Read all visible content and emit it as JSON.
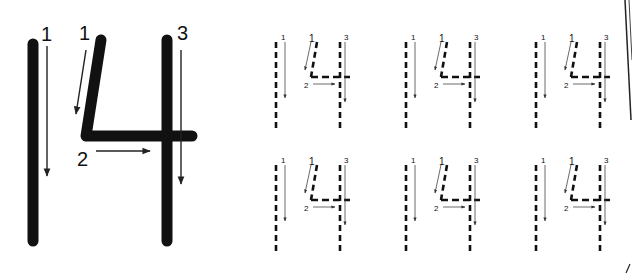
{
  "worksheet": {
    "number": "14",
    "ink_color": "#111111",
    "arrow_color": "#333333",
    "example": {
      "digit_one": {
        "stroke_label": "1"
      },
      "digit_four": {
        "stroke_labels": [
          "1",
          "2",
          "3"
        ]
      }
    },
    "practice": {
      "rows": 2,
      "columns": 3,
      "digit_one_label": "1",
      "digit_four_labels": [
        "1",
        "2",
        "3"
      ]
    }
  }
}
